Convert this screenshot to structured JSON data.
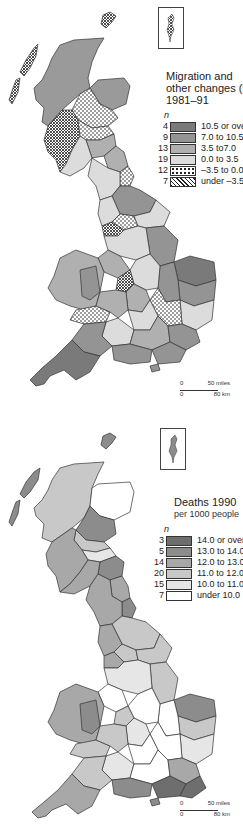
{
  "maps": [
    {
      "id": "migration",
      "title": "Migration and other changes (%)",
      "subtitle": "1981–91",
      "n_label": "n",
      "legend": [
        {
          "count": "4",
          "label": "10.5 or over",
          "fill": "#7a7a7a",
          "pattern": "none"
        },
        {
          "count": "9",
          "label": "7.0 to 10.5",
          "fill": "#949494",
          "pattern": "none"
        },
        {
          "count": "13",
          "label": "3.5 to7.0",
          "fill": "#b0b0b0",
          "pattern": "none"
        },
        {
          "count": "19",
          "label": "0.0 to 3.5",
          "fill": "#dcdcdc",
          "pattern": "none"
        },
        {
          "count": "12",
          "label": "–3.5 to 0.0",
          "fill": "#ffffff",
          "pattern": "dots"
        },
        {
          "count": "7",
          "label": "under –3.5",
          "fill": "#ffffff",
          "pattern": "cross"
        }
      ],
      "scale": {
        "miles_start": "0",
        "miles_end": "50 miles",
        "km_start": "0",
        "km_end": "80 km"
      },
      "inset": "Shetland"
    },
    {
      "id": "deaths",
      "title": "Deaths 1990",
      "subtitle": "per 1000 people",
      "n_label": "n",
      "legend": [
        {
          "count": "3",
          "label": "14.0 or over",
          "fill": "#6e6e6e",
          "pattern": "none"
        },
        {
          "count": "5",
          "label": "13.0 to 14.0",
          "fill": "#8c8c8c",
          "pattern": "none"
        },
        {
          "count": "14",
          "label": "12.0 to 13.0",
          "fill": "#a8a8a8",
          "pattern": "none"
        },
        {
          "count": "20",
          "label": "11.0 to 12.0",
          "fill": "#c8c8c8",
          "pattern": "none"
        },
        {
          "count": "15",
          "label": "10.0 to 11.0",
          "fill": "#e6e6e6",
          "pattern": "none"
        },
        {
          "count": "7",
          "label": "under 10.0",
          "fill": "#ffffff",
          "pattern": "none"
        }
      ],
      "scale": {
        "miles_start": "0",
        "miles_end": "50 miles",
        "km_start": "0",
        "km_end": "80 km"
      },
      "inset": "Shetland"
    }
  ]
}
